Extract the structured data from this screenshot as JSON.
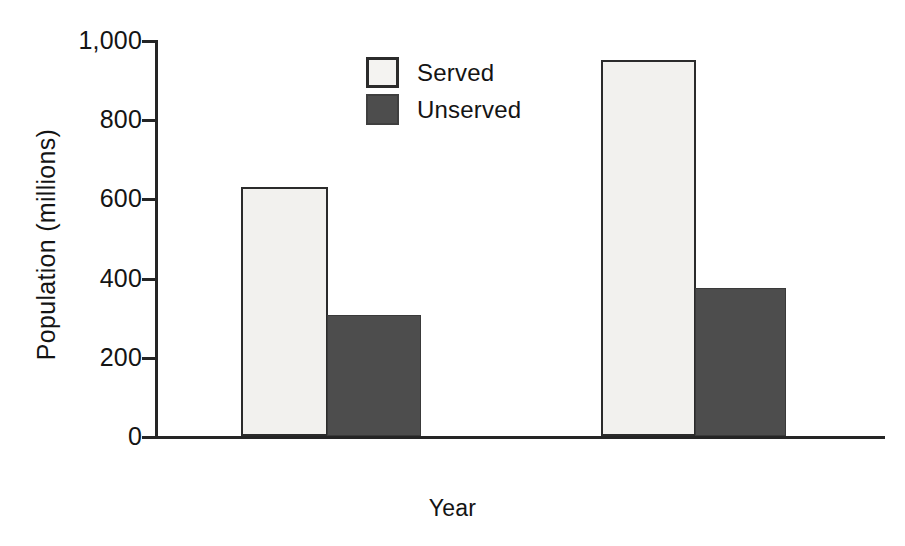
{
  "chart_data": {
    "type": "bar",
    "title": "",
    "xlabel": "Year",
    "ylabel": "Population  (millions)",
    "categories": [
      "",
      ""
    ],
    "series": [
      {
        "name": "Served",
        "values": [
          630,
          950
        ],
        "color": "#f2f1ee"
      },
      {
        "name": "Unserved",
        "values": [
          305,
          375
        ],
        "color": "#4d4d4d"
      }
    ],
    "ylim": [
      0,
      1000
    ],
    "yticks": [
      0,
      200,
      400,
      600,
      800,
      1000
    ],
    "ytick_labels": [
      "0",
      "200",
      "400",
      "600",
      "800",
      "1,000"
    ],
    "grid": false,
    "legend_position": "upper center"
  },
  "axes": {
    "y_title": "Population  (millions)",
    "x_title": "Year",
    "ticks": [
      {
        "label": "1,000",
        "value": 1000
      },
      {
        "label": "800",
        "value": 800
      },
      {
        "label": "600",
        "value": 600
      },
      {
        "label": "400",
        "value": 400
      },
      {
        "label": "200",
        "value": 200
      },
      {
        "label": "0",
        "value": 0
      }
    ]
  },
  "legend": {
    "items": [
      {
        "label": "Served",
        "swatch": "served"
      },
      {
        "label": "Unserved",
        "swatch": "unserved"
      }
    ]
  },
  "bars": [
    {
      "name": "bar-group1-served",
      "series": "Served",
      "value": 630,
      "left": 86,
      "width": 87
    },
    {
      "name": "bar-group1-unserved",
      "series": "Unserved",
      "value": 305,
      "left": 172,
      "width": 94
    },
    {
      "name": "bar-group2-served",
      "series": "Served",
      "value": 950,
      "left": 446,
      "width": 95
    },
    {
      "name": "bar-group2-unserved",
      "series": "Unserved",
      "value": 375,
      "left": 540,
      "width": 91
    }
  ],
  "colors": {
    "served": "#f2f1ee",
    "unserved": "#4d4d4d",
    "axis": "#252525",
    "text": "#141414",
    "background": "#ffffff"
  }
}
